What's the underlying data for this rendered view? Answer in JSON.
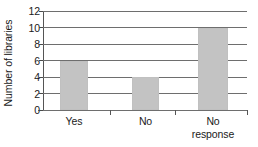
{
  "chart_data": {
    "type": "bar",
    "title": "",
    "xlabel": "",
    "ylabel": "Number of libraries",
    "categories": [
      "Yes",
      "No",
      "No response"
    ],
    "values": [
      6,
      4,
      10
    ],
    "ylim": [
      0,
      12
    ],
    "yticks": [
      0,
      2,
      4,
      6,
      8,
      10,
      12
    ],
    "ytick_labels": [
      "0",
      "2",
      "4",
      "6",
      "8",
      "10",
      "12"
    ],
    "grid": true,
    "legend": false,
    "bar_color": "#c3c3c3",
    "axis_color": "#555555",
    "gridline_color": "#6e6e6e"
  },
  "axis": {
    "y_title": "Number of libraries"
  },
  "categories": [
    {
      "label": "Yes",
      "lines": [
        "Yes"
      ],
      "value": 6
    },
    {
      "label": "No",
      "lines": [
        "No"
      ],
      "value": 4
    },
    {
      "label": "No response",
      "lines": [
        "No",
        "response"
      ],
      "value": 10
    }
  ]
}
